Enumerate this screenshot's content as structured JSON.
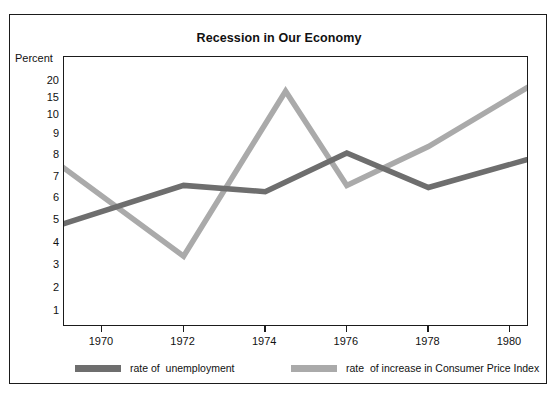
{
  "chart_data": {
    "type": "line",
    "title": "Recession in Our Economy",
    "xlabel": "",
    "ylabel": "Percent",
    "grid": false,
    "legend_position": "bottom",
    "x_ticks": [
      "1970",
      "1972",
      "1974",
      "1976",
      "1978",
      "1980"
    ],
    "y_ticks": [
      "20",
      "15",
      "10",
      "9",
      "8",
      "7",
      "6",
      "5",
      "4",
      "3",
      "2",
      "1"
    ],
    "y_axis_note": "non-linear: compressed above 10",
    "xlim": [
      1969,
      1981
    ],
    "ylim": [
      0,
      22
    ],
    "series": [
      {
        "name": "rate of  unemployment",
        "color": "#6e6e6e",
        "x": [
          1969,
          1972,
          1974,
          1976,
          1978,
          1981
        ],
        "values": [
          4.8,
          6.6,
          6.3,
          8.1,
          6.5,
          8.1
        ]
      },
      {
        "name": "rate  of increase in Consumer Price Index",
        "color": "#aaaaaa",
        "x": [
          1969,
          1972,
          1974.5,
          1976,
          1978,
          1980.9
        ],
        "values": [
          7.5,
          3.4,
          17.0,
          6.6,
          8.4,
          21.5
        ]
      }
    ]
  },
  "legend": {
    "entries": [
      {
        "label": "rate of  unemployment",
        "color": "#6e6e6e"
      },
      {
        "label": "rate  of increase in Consumer Price Index",
        "color": "#aaaaaa"
      }
    ]
  },
  "axis": {
    "unit_label": "Percent"
  }
}
